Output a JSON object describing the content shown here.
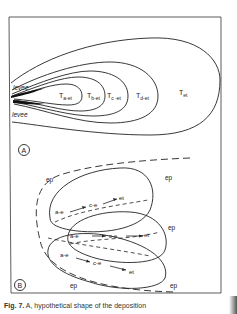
{
  "figure": {
    "panel_a": {
      "label": "A",
      "levee_labels": [
        "levee",
        "levee"
      ],
      "zones": [
        "Ta-et",
        "Tb-et",
        "Tc -et",
        "Td-et",
        "Tet"
      ]
    },
    "panel_b": {
      "label": "B",
      "ep_labels": [
        "ep",
        "ep",
        "ep",
        "ep",
        "ep"
      ],
      "lobes": [
        {
          "seq_a": "a-e",
          "seq_c": "c-e",
          "end": "et"
        },
        {
          "seq_a": "a-e",
          "seq_c": "c-e",
          "end": "et"
        },
        {
          "seq_a": "a-e",
          "seq_c": "c-e",
          "end": "et"
        }
      ]
    },
    "caption": {
      "fig": "Fig. 7.",
      "text": "A, hypothetical shape of the deposition"
    }
  }
}
